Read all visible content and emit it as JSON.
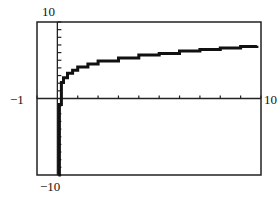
{
  "chart_data": {
    "type": "line",
    "title": "",
    "xlabel": "",
    "ylabel": "",
    "xlim": [
      -1,
      10
    ],
    "ylim": [
      -10,
      10
    ],
    "x_tick_step": 1,
    "y_tick_step": 1,
    "grid": false,
    "axis_labels": {
      "xmin": "−1",
      "xmax": "10",
      "ymin": "−10",
      "ymax": "10"
    },
    "series": [
      {
        "name": "f(x)",
        "style": "stepped calculator pixel curve",
        "x": [
          0.05,
          0.1,
          0.2,
          0.3,
          0.5,
          0.75,
          1,
          1.5,
          2,
          3,
          4,
          5,
          6,
          7,
          8,
          9,
          9.8
        ],
        "values": [
          -10,
          -0.8,
          2.1,
          2.7,
          3.3,
          3.7,
          4.1,
          4.5,
          4.9,
          5.3,
          5.7,
          5.9,
          6.2,
          6.4,
          6.6,
          6.8,
          6.9
        ]
      }
    ]
  }
}
